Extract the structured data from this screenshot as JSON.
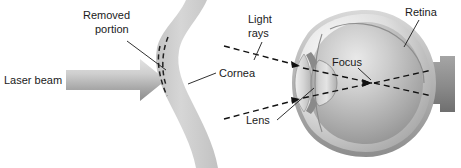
{
  "figure": {
    "kind": "anatomical-diagram",
    "background_color": "#ffffff",
    "width": 461,
    "height": 168
  },
  "labels": {
    "removed_portion_line1": "Removed",
    "removed_portion_line2": "portion",
    "laser_beam": "Laser beam",
    "cornea": "Cornea",
    "light_rays_line1": "Light",
    "light_rays_line2": "rays",
    "lens": "Lens",
    "focus": "Focus",
    "retina": "Retina"
  },
  "colors": {
    "text": "#1a1a1a",
    "cornea_band": "#cfcfcf",
    "cornea_band_edge": "#bdbdbd",
    "laser_arrow_light": "#d8d8d8",
    "laser_arrow_dark": "#8f8f8f",
    "eye_outer": "#b5b5b5",
    "eye_sclera_light": "#f0f0f0",
    "eye_interior_mid": "#b9b9b9",
    "eye_interior_dark": "#7e7e7e",
    "lens_body": "#c8c8c8",
    "ray_stroke": "#111111",
    "leader_stroke": "#1a1a1a"
  },
  "elements": {
    "laser_arrow": "laser-beam-arrow",
    "cornea_band": "enlarged-cornea-band",
    "removed_portion_marks": "removed-portion-dashed-marks",
    "eye_globe": "eye-globe-cross-section",
    "lens_body": "crystalline-lens",
    "iris": "iris",
    "optic_nerve": "optic-nerve-stub",
    "ray_upper_in": "light-ray-upper-incoming",
    "ray_lower_in": "light-ray-lower-incoming",
    "ray_upper_out": "light-ray-upper-to-retina",
    "ray_lower_out": "light-ray-lower-to-retina",
    "focus_point": "focus-point"
  }
}
